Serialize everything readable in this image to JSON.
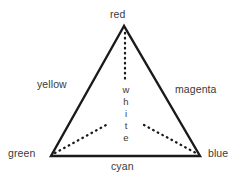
{
  "diagram": {
    "background_color": "#ffffff",
    "stroke_color": "#1a1a1a",
    "text_color": "#3a3a3a",
    "vertices": {
      "top": {
        "label": "red",
        "x": 124,
        "y": 26
      },
      "bottom_left": {
        "label": "green",
        "x": 51,
        "y": 156
      },
      "bottom_right": {
        "label": "blue",
        "x": 200,
        "y": 156
      }
    },
    "edges": {
      "left": {
        "label": "yellow"
      },
      "right": {
        "label": "magenta"
      },
      "bottom": {
        "label": "cyan"
      }
    },
    "center": {
      "label": "white",
      "letters": [
        "w",
        "h",
        "i",
        "t",
        "e"
      ]
    },
    "dotted_lines": [
      {
        "name": "apex-vertical-dotted",
        "x1": 125,
        "y1": 33,
        "x2": 125,
        "y2": 82
      },
      {
        "name": "green-corner-dotted",
        "x1": 55,
        "y1": 153,
        "x2": 106,
        "y2": 125
      },
      {
        "name": "blue-corner-dotted",
        "x1": 144,
        "y1": 125,
        "x2": 196,
        "y2": 153
      }
    ]
  }
}
